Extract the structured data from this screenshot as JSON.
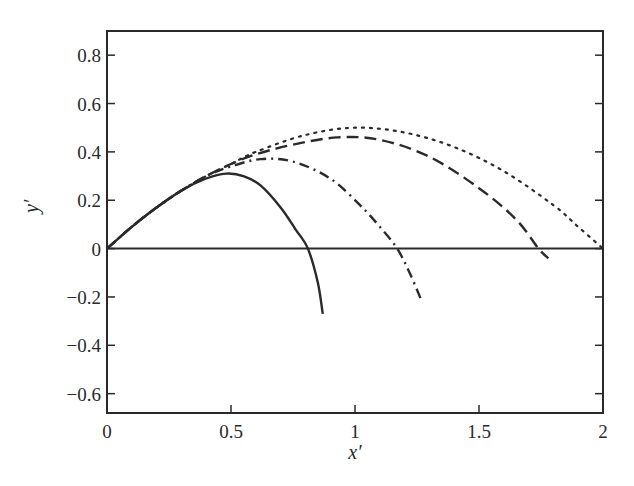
{
  "chart_data": {
    "type": "line",
    "title": "",
    "xlabel": "x′",
    "ylabel": "y′",
    "xlim": [
      0,
      2
    ],
    "ylim": [
      -0.68,
      0.9
    ],
    "xticks": [
      0,
      0.5,
      1,
      1.5,
      2
    ],
    "xtick_labels": [
      "0",
      "0.5",
      "1",
      "1.5",
      "2"
    ],
    "yticks": [
      0.8,
      0.6,
      0.4,
      0.2,
      0,
      -0.2,
      -0.4,
      -0.6
    ],
    "ytick_labels": [
      "0.8",
      "0.6",
      "0.4",
      "0.2",
      "0",
      "−0.2",
      "−0.4",
      "−0.6"
    ],
    "grid": false,
    "legend": null,
    "baseline": {
      "y": 0,
      "style": "solid"
    },
    "series": [
      {
        "name": "solid",
        "style": "solid",
        "x": [
          0,
          0.1,
          0.2,
          0.3,
          0.4,
          0.48,
          0.55,
          0.62,
          0.7,
          0.76,
          0.81,
          0.85,
          0.87
        ],
        "y": [
          0,
          0.09,
          0.17,
          0.24,
          0.29,
          0.31,
          0.3,
          0.26,
          0.17,
          0.08,
          0,
          -0.14,
          -0.27
        ]
      },
      {
        "name": "dash-dot",
        "style": "dashdot",
        "x": [
          0,
          0.1,
          0.2,
          0.3,
          0.4,
          0.5,
          0.62,
          0.75,
          0.9,
          1.02,
          1.1,
          1.17,
          1.22,
          1.27
        ],
        "y": [
          0,
          0.09,
          0.17,
          0.24,
          0.3,
          0.34,
          0.37,
          0.36,
          0.29,
          0.18,
          0.09,
          0,
          -0.1,
          -0.22
        ]
      },
      {
        "name": "dashed",
        "style": "dashed",
        "x": [
          0,
          0.1,
          0.2,
          0.3,
          0.4,
          0.5,
          0.6,
          0.75,
          0.93,
          1.1,
          1.3,
          1.5,
          1.65,
          1.74,
          1.78
        ],
        "y": [
          0,
          0.09,
          0.17,
          0.24,
          0.3,
          0.35,
          0.39,
          0.43,
          0.46,
          0.45,
          0.38,
          0.25,
          0.12,
          0,
          -0.04
        ]
      },
      {
        "name": "dotted",
        "style": "dotted",
        "x": [
          0,
          0.1,
          0.2,
          0.3,
          0.4,
          0.5,
          0.6,
          0.8,
          1.0,
          1.2,
          1.4,
          1.6,
          1.8,
          1.9,
          2.0
        ],
        "y": [
          0,
          0.09,
          0.17,
          0.24,
          0.3,
          0.35,
          0.4,
          0.47,
          0.5,
          0.48,
          0.42,
          0.32,
          0.18,
          0.09,
          0
        ]
      }
    ]
  },
  "layout": {
    "plot_left": 107,
    "plot_right": 603,
    "plot_top": 31,
    "plot_bottom": 413,
    "ink_color": "#2a2a2a"
  }
}
